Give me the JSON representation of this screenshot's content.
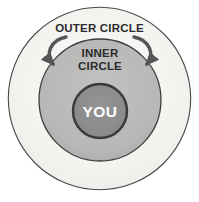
{
  "diagram": {
    "canvas": {
      "width": 199,
      "height": 202,
      "background": "#ffffff"
    },
    "rings": [
      {
        "id": "outer",
        "label": "OUTER CIRCLE",
        "fill": "#f4f4f1",
        "stroke": "#4a4a4a",
        "cx": 99.5,
        "cy": 98,
        "r": 91.5,
        "label_x": 99.5,
        "label_y": 32
      },
      {
        "id": "inner",
        "label_line1": "INNER",
        "label_line2": "CIRCLE",
        "fill": "#b9b9b7",
        "stroke": "#3d3d3d",
        "cx": 100,
        "cy": 100,
        "r": 61,
        "label_x": 100,
        "label_y1": 56,
        "label_y2": 69
      },
      {
        "id": "center",
        "label": "YOU",
        "fill": "#8c8c8c",
        "stroke": "#3a3a3a",
        "cx": 100,
        "cy": 111,
        "r": 27,
        "label_x": 100,
        "label_y": 117
      }
    ],
    "arrows": [
      {
        "id": "arrow-left",
        "name": "curved-arrow-left",
        "color": "#555555",
        "direction": "outer-to-inner"
      },
      {
        "id": "arrow-right",
        "name": "curved-arrow-right",
        "color": "#555555",
        "direction": "outer-to-inner"
      }
    ],
    "colors": {
      "outer_fill": "#f4f4f1",
      "inner_fill": "#b9b9b7",
      "center_fill": "#8c8c8c",
      "stroke": "#3d3d3d",
      "text_dark": "#2b2b2b",
      "text_light": "#ffffff",
      "arrow": "#555555",
      "background": "#ffffff"
    }
  }
}
